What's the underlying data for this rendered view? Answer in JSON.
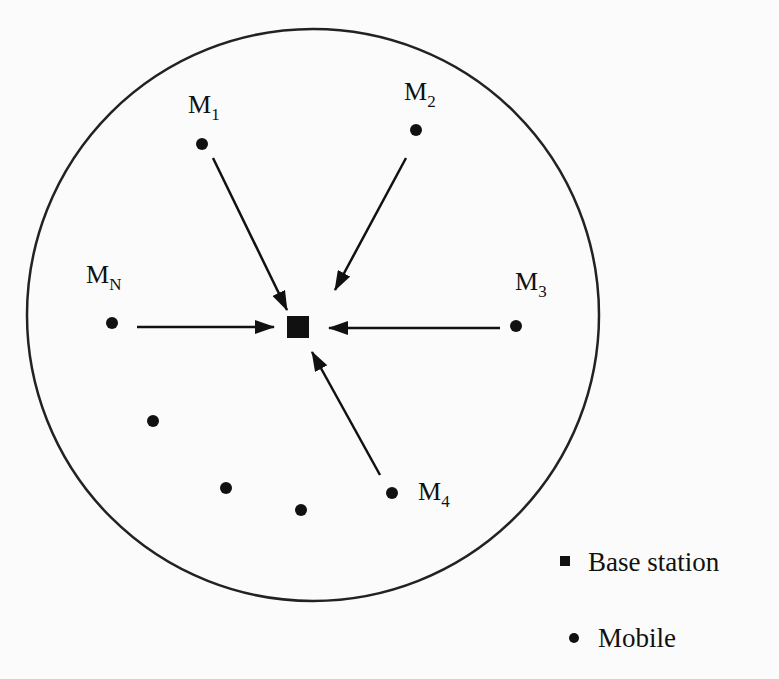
{
  "diagram": {
    "type": "cell network (uplink)",
    "cell_boundary": {
      "shape": "circle",
      "cx": 313,
      "cy": 315,
      "r": 286
    },
    "base_station": {
      "x": 298,
      "y": 327,
      "size": 22
    },
    "mobiles": [
      {
        "id": "m1",
        "label": "M",
        "sub": "1",
        "x": 202,
        "y": 144,
        "labelX": 188,
        "labelY": 113,
        "arrow": true
      },
      {
        "id": "m2",
        "label": "M",
        "sub": "2",
        "x": 416,
        "y": 130,
        "labelX": 404,
        "labelY": 100,
        "arrow": true
      },
      {
        "id": "m3",
        "label": "M",
        "sub": "3",
        "x": 516,
        "y": 326,
        "labelX": 515,
        "labelY": 290,
        "arrow": true
      },
      {
        "id": "m4",
        "label": "M",
        "sub": "4",
        "x": 392,
        "y": 493,
        "labelX": 418,
        "labelY": 500,
        "arrow": true
      },
      {
        "id": "mn",
        "label": "M",
        "sub": "N",
        "x": 112,
        "y": 323,
        "labelX": 86,
        "labelY": 283,
        "arrow": true
      },
      {
        "id": "u1",
        "label": "",
        "sub": "",
        "x": 153,
        "y": 421,
        "arrow": false
      },
      {
        "id": "u2",
        "label": "",
        "sub": "",
        "x": 226,
        "y": 488,
        "arrow": false
      },
      {
        "id": "u3",
        "label": "",
        "sub": "",
        "x": 301,
        "y": 510,
        "arrow": false
      }
    ],
    "arrows": [
      {
        "from": "m1",
        "x1": 213,
        "y1": 158,
        "x2": 287,
        "y2": 310
      },
      {
        "from": "m2",
        "x1": 406,
        "y1": 158,
        "x2": 335,
        "y2": 290
      },
      {
        "from": "mn",
        "x1": 137,
        "y1": 327,
        "x2": 274,
        "y2": 327
      },
      {
        "from": "m3",
        "x1": 500,
        "y1": 328,
        "x2": 329,
        "y2": 328
      },
      {
        "from": "m4",
        "x1": 380,
        "y1": 475,
        "x2": 312,
        "y2": 352
      }
    ]
  },
  "legend": {
    "items": [
      {
        "symbol": "square",
        "label": "Base station"
      },
      {
        "symbol": "circle",
        "label": "Mobile"
      }
    ]
  },
  "colors": {
    "ink": "#111111",
    "background": "#fbfbfb"
  }
}
